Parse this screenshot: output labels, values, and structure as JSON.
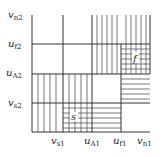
{
  "diagram": {
    "x_labels": [
      {
        "main": "v",
        "sub": "s1"
      },
      {
        "main": "u",
        "sub": "A1"
      },
      {
        "main": "u",
        "sub": "f1"
      },
      {
        "main": "v",
        "sub": "n1"
      }
    ],
    "y_labels": [
      {
        "main": "v",
        "sub": "n2"
      },
      {
        "main": "u",
        "sub": "f2"
      },
      {
        "main": "u",
        "sub": "A2"
      },
      {
        "main": "v",
        "sub": "s2"
      }
    ],
    "regions": {
      "s_label": "s",
      "f_label": "f"
    },
    "colors": {
      "line": "#333333",
      "hatch": "#555555"
    }
  }
}
